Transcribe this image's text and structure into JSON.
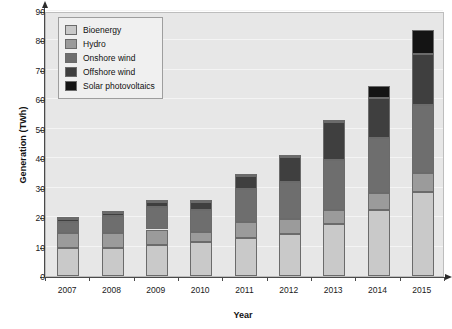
{
  "chart_data": {
    "type": "bar",
    "stacked": true,
    "title": "",
    "xlabel": "Year",
    "ylabel": "Generation (TWh)",
    "categories": [
      "2007",
      "2008",
      "2009",
      "2010",
      "2011",
      "2012",
      "2013",
      "2014",
      "2015"
    ],
    "ylim": [
      0,
      90
    ],
    "yticks": [
      0,
      10,
      20,
      30,
      40,
      50,
      60,
      70,
      80,
      90
    ],
    "grid": true,
    "legend_position": "top-left",
    "series": [
      {
        "name": "Bioenergy",
        "color": "#c9c9c9",
        "values": [
          9.5,
          9.5,
          10.5,
          11.5,
          13.0,
          14.3,
          17.8,
          22.5,
          28.5
        ]
      },
      {
        "name": "Hydro",
        "color": "#9b9b9b",
        "values": [
          5.0,
          5.0,
          5.3,
          3.3,
          5.5,
          5.2,
          4.5,
          5.8,
          6.5
        ]
      },
      {
        "name": "Onshore wind",
        "color": "#6e6e6e",
        "values": [
          3.8,
          6.0,
          7.7,
          7.7,
          11.0,
          12.5,
          17.2,
          18.7,
          23.0
        ]
      },
      {
        "name": "Offshore wind",
        "color": "#3f3f3f",
        "values": [
          1.0,
          1.0,
          1.5,
          2.8,
          4.5,
          8.3,
          12.8,
          13.5,
          17.5
        ]
      },
      {
        "name": "Solar photovoltaics",
        "color": "#141414",
        "values": [
          0.3,
          0.2,
          0.3,
          0.5,
          0.5,
          0.7,
          0.7,
          4.0,
          8.0
        ]
      }
    ],
    "totals": [
      19.6,
      21.7,
      25.3,
      25.8,
      34.5,
      41.0,
      53.0,
      64.5,
      83.5
    ]
  },
  "style": {
    "plot_background": "#e7e7e7",
    "page_background": "#ffffff",
    "gridline_color": "#f4f4f4",
    "axis_color": "#4a4a4a",
    "bar_border": "#6b6b6b",
    "legend_background": "#f0f0f0",
    "legend_border": "#9e9e9e"
  }
}
